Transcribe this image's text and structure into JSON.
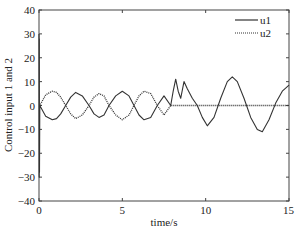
{
  "chart_data": {
    "type": "line",
    "title": "",
    "xlabel": "time/s",
    "ylabel": "Control input 1 and 2",
    "xlim": [
      0,
      15
    ],
    "ylim": [
      -40,
      40
    ],
    "xticks": [
      0,
      5,
      10,
      15
    ],
    "xtick_labels": [
      "0",
      "5",
      "10",
      "15"
    ],
    "yticks": [
      -40,
      -30,
      -20,
      -10,
      0,
      10,
      20,
      30,
      40
    ],
    "ytick_labels": [
      "-40",
      "-30",
      "-20",
      "-10",
      "0",
      "10",
      "20",
      "30",
      "40"
    ],
    "grid": false,
    "legend_position": "upper right",
    "series": [
      {
        "name": "u1",
        "style": "solid",
        "color": "#333333",
        "x": [
          0,
          0.01,
          0.02,
          0.03,
          0.05,
          0.4,
          0.8,
          1.05,
          1.3,
          1.6,
          1.9,
          2.2,
          2.6,
          3.0,
          3.3,
          3.6,
          3.9,
          4.2,
          4.6,
          5.0,
          5.4,
          5.7,
          6.0,
          6.3,
          6.7,
          7.1,
          7.5,
          7.9,
          8.05,
          8.2,
          8.35,
          8.5,
          8.7,
          8.9,
          9.2,
          9.5,
          9.8,
          10.1,
          10.5,
          10.9,
          11.3,
          11.6,
          11.9,
          12.3,
          12.7,
          13.1,
          13.4,
          13.8,
          14.2,
          14.6,
          15.0
        ],
        "y": [
          30,
          -30,
          28,
          -28,
          0,
          -4.5,
          -6,
          -5.5,
          -3.5,
          0,
          3.5,
          5.5,
          4,
          0,
          -3.5,
          -5,
          -4,
          0,
          4,
          6,
          4,
          0,
          -4,
          -6,
          -5,
          0,
          4,
          0,
          6,
          11,
          6,
          3,
          10,
          7,
          3,
          0,
          -5,
          -8.5,
          -5,
          3,
          10,
          12,
          10,
          3,
          -5,
          -10,
          -11,
          -6,
          1,
          6,
          8.5
        ]
      },
      {
        "name": "u2",
        "style": "dotted",
        "color": "#333333",
        "x": [
          0,
          0.05,
          0.4,
          0.8,
          1.05,
          1.3,
          1.6,
          1.9,
          2.2,
          2.6,
          3.0,
          3.3,
          3.6,
          3.9,
          4.2,
          4.6,
          5.0,
          5.4,
          5.7,
          6.0,
          6.3,
          6.7,
          7.1,
          7.5,
          7.9,
          15.0
        ],
        "y": [
          0,
          0,
          4.5,
          6,
          5.5,
          3.5,
          0,
          -3.5,
          -5.5,
          -4,
          0,
          3.5,
          5,
          4,
          0,
          -4,
          -6,
          -4,
          0,
          4,
          6,
          5,
          0,
          -4,
          0,
          0
        ]
      }
    ]
  }
}
